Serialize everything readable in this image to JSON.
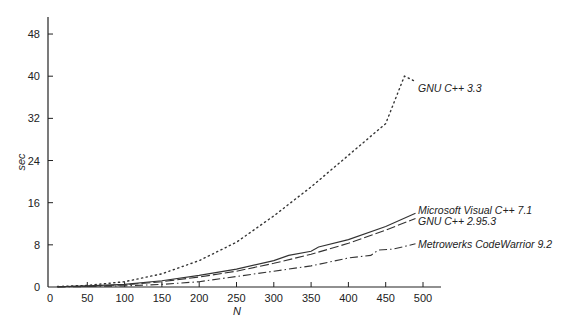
{
  "chart_data": {
    "type": "line",
    "title": "",
    "xlabel": "N",
    "ylabel": "sec",
    "xlim": [
      0,
      500
    ],
    "ylim": [
      0,
      52
    ],
    "x_ticks": [
      0,
      50,
      100,
      150,
      200,
      250,
      300,
      350,
      400,
      450,
      500
    ],
    "y_ticks": [
      0,
      8,
      16,
      24,
      32,
      40,
      48
    ],
    "grid": false,
    "legend_position": "inline-right",
    "series": [
      {
        "name": "GNU C++ 3.3",
        "style": "dotted",
        "x": [
          10,
          50,
          100,
          150,
          200,
          250,
          300,
          350,
          400,
          450,
          475,
          490
        ],
        "y": [
          0.1,
          0.3,
          1.0,
          2.5,
          5.0,
          8.5,
          13.5,
          19.0,
          25.0,
          31.0,
          40.0,
          39.0
        ]
      },
      {
        "name": "Microsoft Visual C++ 7.1",
        "style": "solid",
        "x": [
          10,
          50,
          100,
          150,
          200,
          250,
          300,
          320,
          350,
          360,
          400,
          450,
          490
        ],
        "y": [
          0.05,
          0.2,
          0.5,
          1.2,
          2.2,
          3.4,
          5.0,
          6.0,
          6.8,
          7.6,
          9.0,
          11.5,
          14.0
        ]
      },
      {
        "name": "GNU C++ 2.95.3",
        "style": "long-dash",
        "x": [
          10,
          50,
          100,
          150,
          200,
          250,
          300,
          350,
          400,
          450,
          490
        ],
        "y": [
          0.05,
          0.15,
          0.4,
          1.0,
          1.9,
          3.0,
          4.5,
          6.2,
          8.3,
          10.8,
          13.0
        ]
      },
      {
        "name": "Metrowerks CodeWarrior 9.2",
        "style": "dash-dot",
        "x": [
          10,
          50,
          100,
          150,
          200,
          250,
          300,
          350,
          400,
          430,
          440,
          460,
          490
        ],
        "y": [
          0.0,
          0.1,
          0.2,
          0.5,
          1.0,
          2.0,
          3.0,
          4.0,
          5.5,
          6.0,
          7.0,
          7.2,
          8.2
        ]
      }
    ]
  }
}
